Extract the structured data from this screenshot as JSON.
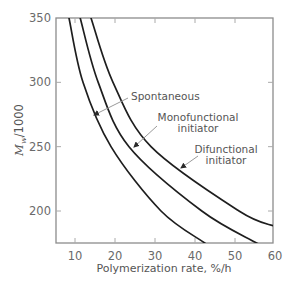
{
  "chart_data": {
    "type": "line",
    "title": "",
    "xlabel": "Polymerization rate, %/h",
    "ylabel": "M_w/1000",
    "ylabel_parts": {
      "main": "M",
      "sub": "w",
      "rest": "/1000"
    },
    "xlim": [
      5,
      60
    ],
    "ylim": [
      175,
      350
    ],
    "xticks": [
      10,
      20,
      30,
      40,
      50,
      60
    ],
    "yticks": [
      200,
      250,
      300,
      350
    ],
    "grid": false,
    "legend": "none (inline annotations with arrows)",
    "series": [
      {
        "name": "Spontaneous",
        "x": [
          8.5,
          12,
          19,
          31.5,
          42.5
        ],
        "y": [
          350,
          300,
          250,
          200,
          175
        ]
      },
      {
        "name": "Monofunctional initiator",
        "x": [
          11.3,
          15.8,
          23.5,
          41.7,
          55.5
        ],
        "y": [
          350,
          300,
          250,
          200,
          175
        ]
      },
      {
        "name": "Difunctional initiator",
        "x": [
          14,
          19.5,
          29,
          51,
          60
        ],
        "y": [
          350,
          300,
          250,
          200,
          188
        ]
      }
    ],
    "annotations": [
      {
        "lines": [
          "Spontaneous"
        ],
        "target_series": 0
      },
      {
        "lines": [
          "Monofunctional",
          "initiator"
        ],
        "target_series": 1
      },
      {
        "lines": [
          "Difunctional",
          "initiator"
        ],
        "target_series": 2
      }
    ]
  },
  "labels": {
    "xlabel": "Polymerization rate, %/h",
    "ylabel_main": "M",
    "ylabel_sub": "w",
    "ylabel_rest": "/1000",
    "xticks": [
      "10",
      "20",
      "30",
      "40",
      "50",
      "60"
    ],
    "yticks": [
      "200",
      "250",
      "300",
      "350"
    ],
    "ann_spont": "Spontaneous",
    "ann_mono_1": "Monofunctional",
    "ann_mono_2": "initiator",
    "ann_di_1": "Difunctional",
    "ann_di_2": "initiator"
  },
  "colors": {
    "frame": "#8c8c8c",
    "curve": "#1e1e1e",
    "arrow": "#9a9a9a",
    "text": "#5a5a5a"
  }
}
